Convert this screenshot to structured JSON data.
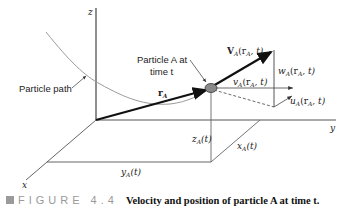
{
  "axes": {
    "x_label": "x",
    "y_label": "y",
    "z_label": "z"
  },
  "labels": {
    "particle_path": "Particle path",
    "particle_a_line1": "Particle A at",
    "particle_a_line2": "time t",
    "position_vector": {
      "main": "r",
      "sub": "A"
    },
    "velocity": {
      "main": "V",
      "sub": "A",
      "args": "(r",
      "args_sub": "A",
      "args_tail": ", t)"
    },
    "w_component": {
      "main": "w",
      "sub": "A",
      "args": "(r",
      "args_sub": "A",
      "args_tail": ", t)"
    },
    "v_component": {
      "main": "v",
      "sub": "A",
      "args": "(r",
      "args_sub": "A",
      "args_tail": ", t)"
    },
    "u_component": {
      "main": "u",
      "sub": "A",
      "args": "(r",
      "args_sub": "A",
      "args_tail": ", t)"
    },
    "z_coord": {
      "main": "z",
      "sub": "A",
      "tail": "(t)"
    },
    "y_coord": {
      "main": "y",
      "sub": "A",
      "tail": "(t)"
    },
    "x_coord": {
      "main": "x",
      "sub": "A",
      "tail": "(t)"
    }
  },
  "caption": {
    "tag": "FIGURE 4.4",
    "text": "Velocity and position of particle A at time t."
  },
  "colors": {
    "axis": "#555555",
    "vector": "#111111",
    "path": "#9a9a9a",
    "particle": "#8a8a8a"
  }
}
